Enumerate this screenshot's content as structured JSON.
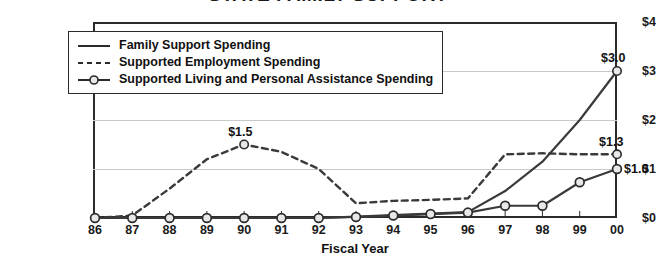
{
  "chart_data": {
    "type": "line",
    "title": "STATE FAMILY SUPPORT",
    "xlabel": "Fiscal Year",
    "ylabel": "",
    "categories": [
      "86",
      "87",
      "88",
      "89",
      "90",
      "91",
      "92",
      "93",
      "94",
      "95",
      "96",
      "97",
      "98",
      "99",
      "00"
    ],
    "ylim": [
      0,
      4
    ],
    "yticks": [
      "$0",
      "$1",
      "$2",
      "$3",
      "$4"
    ],
    "ytick_values": [
      0,
      1,
      2,
      3,
      4
    ],
    "grid": true,
    "legend_position": "upper-left-inside",
    "series": [
      {
        "name": "Family Support Spending",
        "style": "solid",
        "marker": "none",
        "values": [
          0,
          0,
          0,
          0,
          0,
          0,
          0,
          0.03,
          0.06,
          0.09,
          0.12,
          0.55,
          1.15,
          2.0,
          3.0
        ]
      },
      {
        "name": "Supported Employment Spending",
        "style": "dashed",
        "marker": "none",
        "values": [
          0,
          0.05,
          0.6,
          1.2,
          1.5,
          1.35,
          1.0,
          0.3,
          0.35,
          0.37,
          0.4,
          1.3,
          1.32,
          1.3,
          1.3
        ]
      },
      {
        "name": "Supported Living and Personal Assistance Spending",
        "style": "solid",
        "marker": "circle",
        "values": [
          0,
          0,
          0,
          0,
          0,
          0,
          0,
          0.02,
          0.05,
          0.08,
          0.11,
          0.25,
          0.25,
          0.73,
          1.0
        ]
      }
    ],
    "annotations": [
      {
        "text": "$1.5",
        "series": "Supported Employment Spending",
        "category": "90",
        "value": 1.5
      },
      {
        "text": "$3.0",
        "series": "Family Support Spending",
        "category": "00",
        "value": 3.0
      },
      {
        "text": "$1.3",
        "series": "Supported Employment Spending",
        "category": "00",
        "value": 1.3
      },
      {
        "text": "$1.0",
        "series": "Supported Living and Personal Assistance Spending",
        "category": "00",
        "value": 1.0
      }
    ],
    "colors": {
      "axis": "#2b2b2b",
      "grid": "#c9c9c9",
      "line": "#3a3a3a",
      "marker_fill": "#e8e8e8",
      "background": "#ffffff"
    }
  }
}
